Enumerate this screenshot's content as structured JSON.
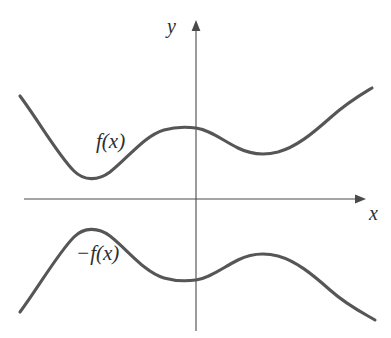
{
  "figure": {
    "background_color": "#ffffff",
    "curve_color": "#565656",
    "axis_color": "#4a4a4a",
    "text_color": "#2e2e2e"
  },
  "axes": {
    "x_label": "x",
    "y_label": "y",
    "x_axis": {
      "start_px": 24,
      "end_px": 362,
      "y_px": 199,
      "arrow": "right"
    },
    "y_axis": {
      "x_px": 196,
      "top_px": 22,
      "bottom_px": 331,
      "arrow": "up"
    },
    "origin_px": {
      "x": 196,
      "y": 199
    }
  },
  "labels": {
    "upper_curve": "f(x)",
    "lower_curve": "−f(x)"
  },
  "chart_data": {
    "type": "line",
    "title": "",
    "xlabel": "x",
    "ylabel": "y",
    "grid": false,
    "legend": "none",
    "axis_style": "arrows, no tick marks, no tick labels",
    "xlim": [
      -5.5,
      5.5
    ],
    "ylim": [
      -3.4,
      3.4
    ],
    "series": [
      {
        "name": "f(x)",
        "label_text": "f(x)",
        "label_position": {
          "x": -3.0,
          "y": 1.45
        },
        "description": "W-shaped curve entirely above the x-axis: falls from upper left to a local minimum, rises to a local maximum on the y-axis, falls to a second local minimum, then rises to upper right",
        "x": [
          -5.2,
          -4.4,
          -3.6,
          -2.8,
          -2.1,
          -1.4,
          -0.7,
          0.0,
          0.7,
          1.4,
          2.0,
          2.6,
          3.2,
          3.9,
          4.6,
          5.2
        ],
        "y": [
          2.12,
          1.7,
          1.26,
          0.86,
          0.69,
          0.86,
          1.26,
          1.46,
          1.36,
          1.12,
          0.92,
          0.8,
          0.84,
          1.16,
          1.62,
          2.22
        ],
        "key_points": [
          {
            "role": "left-endpoint",
            "x": -5.2,
            "y": 2.12,
            "px": [
              20,
              96
            ]
          },
          {
            "role": "local-minimum",
            "x": -2.1,
            "y": 0.69,
            "px": [
              90,
              178
            ]
          },
          {
            "role": "local-maximum",
            "x": 0.0,
            "y": 1.46,
            "px": [
              196,
              128
            ]
          },
          {
            "role": "local-minimum",
            "x": 2.6,
            "y": 0.8,
            "px": [
              275,
              152
            ]
          },
          {
            "role": "right-endpoint",
            "x": 5.2,
            "y": 2.22,
            "px": [
              372,
              88
            ]
          }
        ]
      },
      {
        "name": "-f(x)",
        "label_text": "−f(x)",
        "label_position": {
          "x": -3.3,
          "y": -1.55
        },
        "description": "Mirror image of f(x) reflected about the x-axis, entirely below the x-axis: rises from lower left to a local maximum, falls to a local minimum on the y-axis, rises to a second local maximum, then falls to lower right",
        "x": [
          -5.2,
          -4.4,
          -3.6,
          -2.8,
          -2.1,
          -1.4,
          -0.7,
          0.0,
          0.7,
          1.4,
          2.0,
          2.6,
          3.2,
          3.9,
          4.6,
          5.2
        ],
        "y": [
          -2.12,
          -1.7,
          -1.26,
          -0.86,
          -0.69,
          -0.86,
          -1.26,
          -1.46,
          -1.36,
          -1.12,
          -0.92,
          -0.8,
          -0.84,
          -1.16,
          -1.62,
          -2.22
        ],
        "key_points": [
          {
            "role": "left-endpoint",
            "x": -5.2,
            "y": -2.12,
            "px": [
              20,
              312
            ]
          },
          {
            "role": "local-maximum",
            "x": -2.1,
            "y": -0.69,
            "px": [
              90,
              239
            ]
          },
          {
            "role": "local-minimum",
            "x": 0.0,
            "y": -1.46,
            "px": [
              196,
              282
            ]
          },
          {
            "role": "local-maximum",
            "x": 2.6,
            "y": -0.8,
            "px": [
              275,
              262
            ]
          },
          {
            "role": "right-endpoint",
            "x": 5.2,
            "y": -2.22,
            "px": [
              375,
              320
            ]
          }
        ]
      }
    ]
  },
  "paths": {
    "x_axis_line": "M 24 199 L 358 199",
    "x_axis_arrow": "M 355 194.6 L 366 199 L 355 203.4 Z",
    "y_axis_line": "M 196 28 L 196 331",
    "y_axis_arrow": "M 191.6 31 L 196 20 L 200.4 31 Z",
    "upper_curve": "M 20 96 C 38 120, 58 155, 74 171 C 84 181, 98 181, 110 172 C 128 158, 144 136, 164 130 C 178 126, 188 127, 196 128 C 210 130, 222 140, 238 148 C 252 155, 266 155, 278 152 C 296 147, 312 134, 330 118 C 348 102, 362 94, 372 88",
    "lower_curve": "M 20 312 C 38 288, 58 253, 74 237 C 84 227, 98 227, 110 236 C 128 250, 144 272, 164 278 C 178 282, 188 281, 196 280 C 210 278, 222 268, 238 260 C 252 253, 266 253, 278 256 C 296 261, 312 274, 330 290 C 348 306, 365 314, 375 320"
  }
}
